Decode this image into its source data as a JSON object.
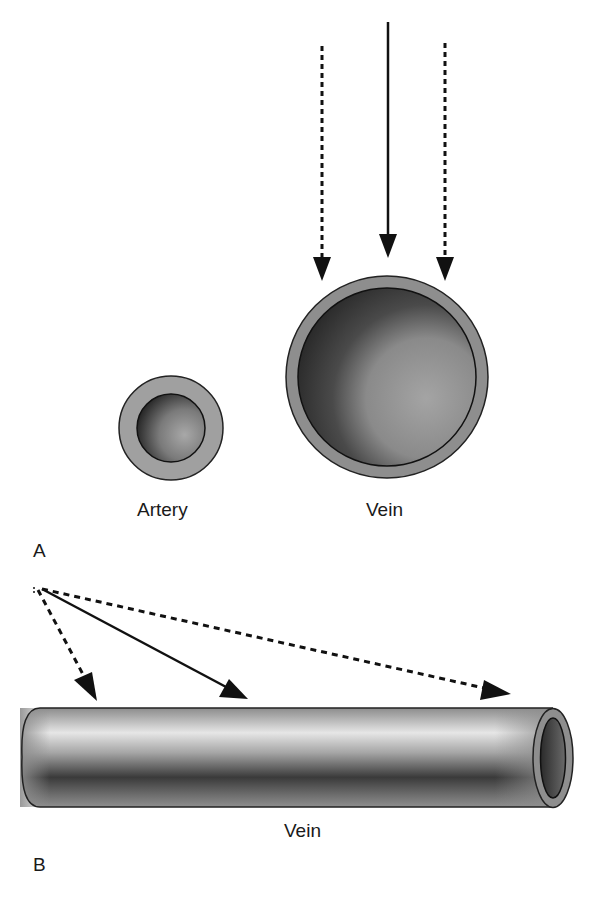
{
  "labels": {
    "artery": "Artery",
    "vein_top": "Vein",
    "vein_bottom": "Vein",
    "panel_a": "A",
    "panel_b": "B"
  },
  "colors": {
    "wall": "#8e8e8e",
    "outline": "#222222",
    "lumen_dark": "#2a2a2a",
    "lumen_light": "#9a9a9a",
    "arrow": "#111111"
  },
  "panel_a": {
    "vessels": [
      {
        "name": "Artery",
        "cx": 171,
        "cy": 428,
        "outer_r": 52,
        "inner_r": 34
      },
      {
        "name": "Vein",
        "cx": 387,
        "cy": 377,
        "outer_r": 101,
        "inner_r": 89
      }
    ],
    "arrows": [
      {
        "style": "dashed",
        "from": [
          322,
          45
        ],
        "to": [
          322,
          280
        ]
      },
      {
        "style": "solid",
        "from": [
          388,
          22
        ],
        "to": [
          388,
          257
        ]
      },
      {
        "style": "dashed",
        "from": [
          445,
          42
        ],
        "to": [
          445,
          278
        ]
      }
    ]
  },
  "panel_b": {
    "tube": {
      "left": 22,
      "right": 553,
      "top": 708,
      "bottom": 807
    },
    "arrows": [
      {
        "style": "dashed",
        "from": [
          40,
          589
        ],
        "to": [
          97,
          700
        ]
      },
      {
        "style": "solid",
        "from": [
          40,
          589
        ],
        "to": [
          247,
          698
        ]
      },
      {
        "style": "dashed",
        "from": [
          40,
          589
        ],
        "to": [
          510,
          694
        ]
      }
    ]
  }
}
